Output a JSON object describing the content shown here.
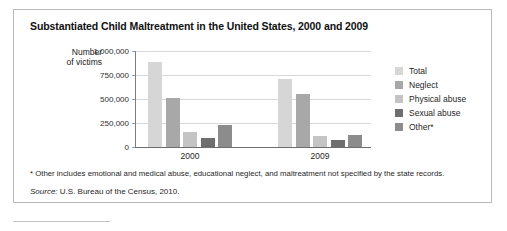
{
  "figure": {
    "title": "Substantiated Child Maltreatment in the United States, 2000 and 2009",
    "y_axis_caption_line1": "Number",
    "y_axis_caption_line2": "of victims",
    "footnote": "* Other includes emotional and medical abuse, educational neglect, and maltreatment not specified by the state records.",
    "source_prefix": "Source:",
    "source_text": " U.S. Bureau of the Census, 2010."
  },
  "colors": {
    "total": "#d6d6d6",
    "neglect": "#a8a8a8",
    "physical_abuse": "#c4c4c4",
    "sexual_abuse": "#6e6e6e",
    "other": "#8c8c8c",
    "axis": "#6e6e6e",
    "gridline": "#d8d8d8",
    "frame_border": "#b9b9b9",
    "text": "#1a1a1a"
  },
  "chart_data": {
    "type": "bar",
    "title": "Substantiated Child Maltreatment in the United States, 2000 and 2009",
    "xlabel": "",
    "ylabel": "Number of victims",
    "categories": [
      "2000",
      "2009"
    ],
    "ylim": [
      0,
      1000000
    ],
    "yticks": [
      0,
      250000,
      500000,
      750000,
      1000000
    ],
    "ytick_labels": [
      "0",
      "250,000",
      "500,000",
      "750,000",
      "1,000,000"
    ],
    "grid": true,
    "legend_position": "right",
    "series": [
      {
        "name": "Total",
        "color_key": "total",
        "values": [
          880000,
          710000
        ]
      },
      {
        "name": "Neglect",
        "color_key": "neglect",
        "values": [
          510000,
          555000
        ]
      },
      {
        "name": "Physical abuse",
        "color_key": "physical_abuse",
        "values": [
          150000,
          115000
        ]
      },
      {
        "name": "Sexual abuse",
        "color_key": "sexual_abuse",
        "values": [
          85000,
          65000
        ]
      },
      {
        "name": "Other*",
        "color_key": "other",
        "values": [
          230000,
          125000
        ]
      }
    ],
    "annotations": [
      "* Other includes emotional and medical abuse, educational neglect, and maltreatment not specified by the state records.",
      "Source: U.S. Bureau of the Census, 2010."
    ]
  }
}
